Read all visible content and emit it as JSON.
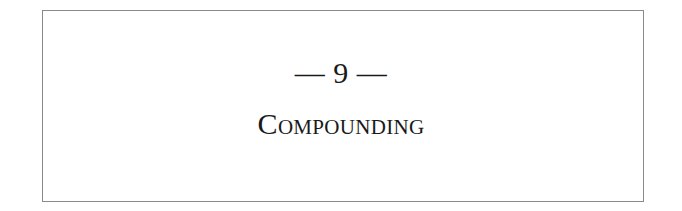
{
  "chapter": {
    "number_label": "— 9 —",
    "number": 9,
    "title": "Compounding"
  },
  "colors": {
    "border": "#8a8a8a",
    "text": "#1a1a1a",
    "background": "#ffffff"
  }
}
